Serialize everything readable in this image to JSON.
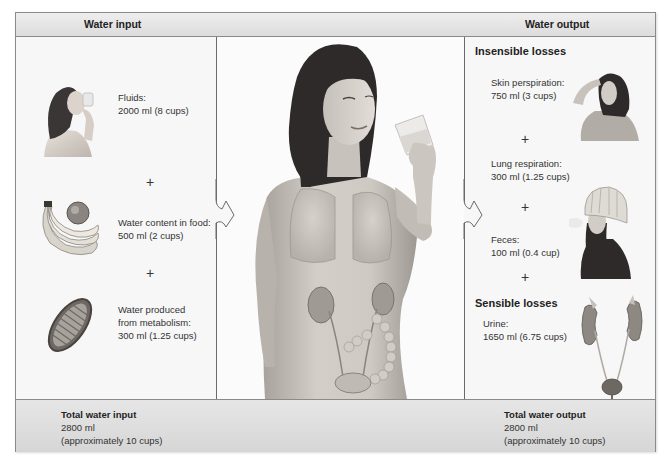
{
  "header": {
    "input_title": "Water input",
    "output_title": "Water output"
  },
  "input": {
    "items": [
      {
        "label": "Fluids:",
        "value": "2000 ml (8 cups)",
        "icon": "person-drinking-icon"
      },
      {
        "label": "Water content in food:",
        "value": "500 ml (2 cups)",
        "icon": "bananas-apple-icon"
      },
      {
        "label_line1": "Water produced",
        "label_line2": "from metabolism:",
        "value": "300 ml (1.25 cups)",
        "icon": "mitochondrion-icon"
      }
    ],
    "plus": "+"
  },
  "center": {
    "illustration": "woman-drinking-water-with-organs"
  },
  "output": {
    "insensible_title": "Insensible losses",
    "sensible_title": "Sensible losses",
    "items": [
      {
        "label": "Skin perspiration:",
        "value": "750 ml (3 cups)",
        "icon": "person-sweating-icon"
      },
      {
        "label": "Lung respiration:",
        "value": "300 ml (1.25 cups)",
        "icon": "person-breathing-cold-icon"
      },
      {
        "label": "Feces:",
        "value": "100 ml (0.4 cup)"
      },
      {
        "label": "Urine:",
        "value": "1650 ml (6.75 cups)",
        "icon": "kidneys-bladder-icon"
      }
    ],
    "plus": "+"
  },
  "footer": {
    "input_total_title": "Total water input",
    "input_total_value": "2800 ml",
    "input_total_note": "(approximately 10 cups)",
    "output_total_title": "Total water output",
    "output_total_value": "2800 ml",
    "output_total_note": "(approximately 10 cups)"
  },
  "colors": {
    "frame_border": "#8a8a8a",
    "header_bg": "#e2e2e2",
    "panel_bg": "#f7f7f7",
    "text": "#333333"
  }
}
